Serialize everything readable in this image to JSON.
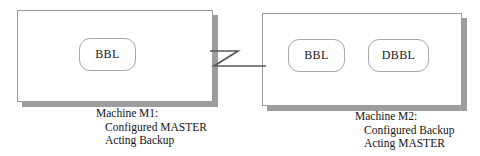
{
  "diagram": {
    "background_color": "#ffffff",
    "line_color": "#555555",
    "box_border_color": "#9a9a9a",
    "shadow_color": "#9d9d9d",
    "text_color": "#141414"
  },
  "machines": [
    {
      "id": "M1",
      "processes": [
        {
          "id": "m1-bbl",
          "label": "BBL"
        }
      ],
      "caption": {
        "head": "Machine M1:",
        "line2": "Configured MASTER",
        "line3": "Acting Backup"
      }
    },
    {
      "id": "M2",
      "processes": [
        {
          "id": "m2-bbl",
          "label": "BBL"
        },
        {
          "id": "m2-dbbl",
          "label": "DBBL"
        }
      ],
      "caption": {
        "head": "Machine M2:",
        "line2": "Configured Backup",
        "line3": "Acting MASTER"
      }
    }
  ],
  "connector": {
    "name": "network-link",
    "shape": "z-shaped-line",
    "from": "M1",
    "to": "M2"
  }
}
